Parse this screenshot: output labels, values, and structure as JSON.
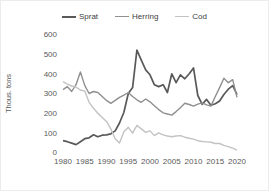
{
  "chart_data": {
    "type": "line",
    "title": "",
    "xlabel": "",
    "ylabel": "Thous. tons",
    "ylim": [
      0,
      600
    ],
    "yticks": [
      0,
      100,
      200,
      300,
      400,
      500,
      600
    ],
    "xticks": [
      1980,
      1985,
      1990,
      1995,
      2000,
      2005,
      2010,
      2015,
      2020
    ],
    "grid": false,
    "legend_position": "top",
    "x": [
      1980,
      1981,
      1982,
      1983,
      1984,
      1985,
      1986,
      1987,
      1988,
      1989,
      1990,
      1991,
      1992,
      1993,
      1994,
      1995,
      1996,
      1997,
      1998,
      1999,
      2000,
      2001,
      2002,
      2003,
      2004,
      2005,
      2006,
      2007,
      2008,
      2009,
      2010,
      2011,
      2012,
      2013,
      2014,
      2015,
      2016,
      2017,
      2018,
      2019,
      2020
    ],
    "series": [
      {
        "name": "Sprat",
        "color": "#595959",
        "values": [
          60,
          55,
          48,
          40,
          55,
          70,
          75,
          90,
          80,
          88,
          90,
          95,
          110,
          150,
          205,
          300,
          330,
          520,
          470,
          420,
          395,
          345,
          335,
          345,
          305,
          400,
          355,
          395,
          375,
          400,
          430,
          290,
          245,
          270,
          240,
          248,
          262,
          295,
          322,
          340,
          295
        ]
      },
      {
        "name": "Herring",
        "color": "#8f8f8f",
        "values": [
          320,
          335,
          310,
          345,
          410,
          340,
          300,
          310,
          305,
          285,
          265,
          250,
          265,
          280,
          292,
          305,
          285,
          268,
          255,
          272,
          258,
          238,
          218,
          202,
          196,
          190,
          208,
          228,
          250,
          244,
          236,
          246,
          252,
          242,
          236,
          285,
          330,
          378,
          355,
          370,
          280
        ]
      },
      {
        "name": "Cod",
        "color": "#c3c3c3",
        "values": [
          360,
          348,
          338,
          332,
          318,
          312,
          255,
          225,
          200,
          178,
          158,
          120,
          70,
          48,
          105,
          128,
          98,
          138,
          120,
          102,
          110,
          86,
          100,
          90,
          84,
          80,
          84,
          86,
          78,
          72,
          68,
          60,
          56,
          54,
          52,
          46,
          46,
          36,
          30,
          22,
          12
        ]
      }
    ]
  }
}
